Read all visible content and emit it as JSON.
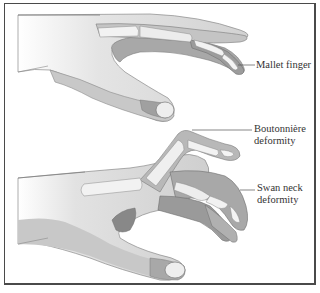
{
  "figure": {
    "type": "anatomical-illustration",
    "colors": {
      "skin_light": "#e6e6e6",
      "skin_mid": "#c4c4c4",
      "skin_dark": "#a8a8a8",
      "shadow": "#8a8a8a",
      "bone": "#f2f2f2",
      "outline": "#6e6e6e",
      "border": "#4a4a4a",
      "text": "#333333"
    }
  },
  "labels": {
    "mallet": "Mallet finger",
    "boutonniere_line1": "Boutonnière",
    "boutonniere_line2": "deformity",
    "swan_line1": "Swan neck",
    "swan_line2": "deformity"
  }
}
